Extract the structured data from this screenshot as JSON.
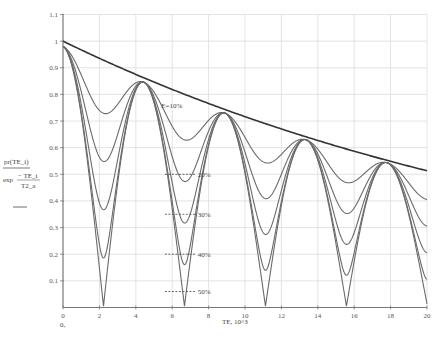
{
  "chart_data": {
    "type": "line",
    "title": "",
    "xlabel": "TE, 10^3",
    "x_origin_label": "0,",
    "ylabel": {
      "numerator": "pr(TE_i)",
      "denominator_func": "exp",
      "denominator_num": "− TE_i",
      "denominator_den": "T2_a"
    },
    "xlim": [
      0,
      20
    ],
    "ylim": [
      0,
      1.1
    ],
    "grid": true,
    "x_ticks": [
      0,
      2,
      4,
      6,
      8,
      10,
      12,
      14,
      16,
      18,
      20
    ],
    "x_tick_labels": [
      "0",
      "2",
      "4",
      "6",
      "8",
      "10",
      "12",
      "14",
      "16",
      "18",
      "20"
    ],
    "y_ticks": [
      0.1,
      0.2,
      0.3,
      0.4,
      0.5,
      0.6,
      0.7,
      0.8,
      0.9,
      1,
      1.1
    ],
    "y_tick_labels": [
      "0.1",
      "0.2",
      "0.3",
      "0.4",
      "0.5",
      "0.6",
      "0.7",
      "0.8",
      "0.9",
      "1",
      "1.1"
    ],
    "envelope": {
      "name": "exp(-TE/T2)",
      "x": [
        0,
        2,
        4,
        6,
        8,
        10,
        12,
        14,
        16,
        18,
        20
      ],
      "values": [
        1.0,
        0.935,
        0.875,
        0.819,
        0.766,
        0.716,
        0.67,
        0.627,
        0.586,
        0.549,
        0.513
      ]
    },
    "series": [
      {
        "name": "E=10%",
        "epsilon": 0.1,
        "minima": [
          0.72,
          0.62,
          0.53,
          0.45
        ],
        "peaks": [
          0.97,
          0.83,
          0.72,
          0.62,
          0.535
        ]
      },
      {
        "name": "20%",
        "epsilon": 0.2,
        "minima": [
          0.54,
          0.46,
          0.4,
          0.34
        ],
        "peaks": [
          0.97,
          0.83,
          0.72,
          0.62,
          0.535
        ]
      },
      {
        "name": "30%",
        "epsilon": 0.3,
        "minima": [
          0.365,
          0.31,
          0.27,
          0.23
        ],
        "peaks": [
          0.97,
          0.83,
          0.72,
          0.62,
          0.535
        ]
      },
      {
        "name": "40%",
        "epsilon": 0.4,
        "minima": [
          0.18,
          0.155,
          0.135,
          0.115
        ],
        "peaks": [
          0.97,
          0.83,
          0.72,
          0.62,
          0.535
        ]
      },
      {
        "name": "50%",
        "epsilon": 0.5,
        "minima": [
          0.01,
          0.01,
          0.01,
          0.01
        ],
        "peaks": [
          0.97,
          0.83,
          0.72,
          0.62,
          0.535
        ]
      }
    ],
    "minima_x": [
      2.2,
      6.7,
      11.15,
      15.6
    ],
    "peaks_x": [
      0,
      4.45,
      8.9,
      13.35,
      17.8
    ],
    "model": {
      "T2": 30,
      "period": 4.45,
      "scale": 0.975
    },
    "annotations": [
      {
        "text": "E=10%",
        "x": 5.4,
        "y": 0.76
      },
      {
        "text": "20%",
        "x": 7.4,
        "y": 0.5,
        "dash_from": 5.6,
        "dash_to": 7.3
      },
      {
        "text": "30%",
        "x": 7.4,
        "y": 0.35,
        "dash_from": 5.6,
        "dash_to": 7.3
      },
      {
        "text": "40%",
        "x": 7.4,
        "y": 0.2,
        "dash_from": 5.6,
        "dash_to": 7.3
      },
      {
        "text": "50%",
        "x": 7.4,
        "y": 0.06,
        "dash_from": 5.6,
        "dash_to": 7.3
      }
    ]
  }
}
